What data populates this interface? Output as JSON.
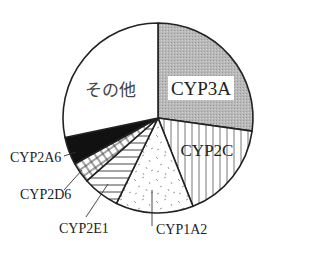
{
  "chart_data": {
    "type": "pie",
    "title": "",
    "start_angle_deg": -90,
    "direction": "clockwise",
    "center": [
      158,
      118
    ],
    "radius": 95,
    "slices": [
      {
        "label": "CYP3A",
        "value": 27.2,
        "pattern": "gray-dots",
        "label_style": "boxed-inside"
      },
      {
        "label": "CYP2C",
        "value": 16.8,
        "pattern": "vertical-lines",
        "label_style": "inside"
      },
      {
        "label": "CYP1A2",
        "value": 13.2,
        "pattern": "speckle",
        "label_style": "leader"
      },
      {
        "label": "CYP2E1",
        "value": 6.3,
        "pattern": "horizontal-lines",
        "label_style": "leader"
      },
      {
        "label": "CYP2D6",
        "value": 3.5,
        "pattern": "crosshatch",
        "label_style": "leader"
      },
      {
        "label": "CYP2A6",
        "value": 4.7,
        "pattern": "solid-black",
        "label_style": "leader"
      },
      {
        "label": "その他",
        "value": 28.3,
        "pattern": "white",
        "label_style": "inside"
      }
    ],
    "legend": "none",
    "colors": {
      "outline": "#222222",
      "fill_gray": "#b8b8b8",
      "fill_black": "#111111",
      "fill_white": "#ffffff"
    }
  },
  "labels": {
    "cyp3a": "CYP3A",
    "cyp2c": "CYP2C",
    "cyp1a2": "CYP1A2",
    "cyp2e1": "CYP2E1",
    "cyp2d6": "CYP2D6",
    "cyp2a6": "CYP2A6",
    "other": "その他"
  }
}
